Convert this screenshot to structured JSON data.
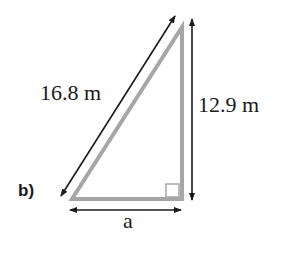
{
  "diagram": {
    "part_label": "b)",
    "hypotenuse_label": "16.8 m",
    "vertical_side_label": "12.9 m",
    "base_label": "a",
    "colors": {
      "triangle_stroke": "#a6a6a6",
      "arrow": "#1a1a1a",
      "text": "#1a1a1a"
    },
    "right_angle_marker": true
  }
}
